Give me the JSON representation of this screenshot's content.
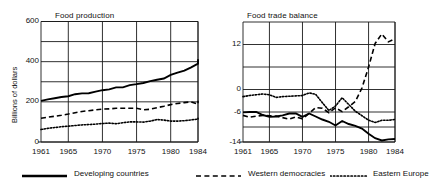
{
  "figure": {
    "ylabel": "Billions of dollars",
    "legend": [
      {
        "label": "Developing countries",
        "style": "solid"
      },
      {
        "label": "Western democracies",
        "style": "dashed"
      },
      {
        "label": "Eastern Europe",
        "style": "dotted"
      }
    ]
  },
  "chart_data": [
    {
      "type": "line",
      "title": "Food production",
      "xlabel": "",
      "ylabel": "Billions of dollars",
      "xlim": [
        1961,
        1984
      ],
      "ylim": [
        0,
        600
      ],
      "yticks": [
        0,
        200,
        400,
        600
      ],
      "xticks": [
        1961,
        1965,
        1970,
        1975,
        1980,
        1984
      ],
      "grid": true,
      "legend_position": "below-figure",
      "x": [
        1961,
        1962,
        1963,
        1964,
        1965,
        1966,
        1967,
        1968,
        1969,
        1970,
        1971,
        1972,
        1973,
        1974,
        1975,
        1976,
        1977,
        1978,
        1979,
        1980,
        1981,
        1982,
        1983,
        1984
      ],
      "series": [
        {
          "name": "Developing countries",
          "style": "solid",
          "values": [
            205,
            212,
            218,
            224,
            228,
            238,
            242,
            243,
            251,
            258,
            262,
            272,
            272,
            283,
            288,
            294,
            303,
            310,
            316,
            334,
            345,
            355,
            372,
            390,
            412
          ]
        },
        {
          "name": "Western democracies",
          "style": "dashed",
          "values": [
            118,
            124,
            128,
            133,
            139,
            146,
            152,
            156,
            160,
            164,
            165,
            168,
            168,
            168,
            168,
            160,
            163,
            171,
            178,
            186,
            192,
            196,
            200,
            188,
            205
          ]
        },
        {
          "name": "Eastern Europe",
          "style": "dotted",
          "values": [
            62,
            68,
            72,
            76,
            79,
            82,
            85,
            87,
            89,
            92,
            94,
            91,
            96,
            100,
            100,
            99,
            104,
            112,
            109,
            104,
            104,
            106,
            110,
            114,
            118
          ]
        }
      ]
    },
    {
      "type": "line",
      "title": "Food trade balance",
      "xlabel": "",
      "ylabel": "",
      "xlim": [
        1961,
        1984
      ],
      "ylim": [
        -14,
        18
      ],
      "yticks": [
        -14,
        -6,
        0,
        12
      ],
      "xticks": [
        1961,
        1965,
        1970,
        1975,
        1980,
        1984
      ],
      "grid": true,
      "legend_position": "below-figure",
      "x": [
        1961,
        1962,
        1963,
        1964,
        1965,
        1966,
        1967,
        1968,
        1969,
        1970,
        1971,
        1972,
        1973,
        1974,
        1975,
        1976,
        1977,
        1978,
        1979,
        1980,
        1981,
        1982,
        1983,
        1984
      ],
      "series": [
        {
          "name": "Developing countries",
          "style": "solid",
          "values": [
            -6.1,
            -6.0,
            -6.0,
            -6.8,
            -7.3,
            -7.2,
            -6.9,
            -6.4,
            -6.4,
            -7.3,
            -6.4,
            -7.2,
            -8.0,
            -8.6,
            -9.6,
            -8.4,
            -9.2,
            -9.7,
            -10.4,
            -11.8,
            -13.0,
            -13.6,
            -13.3,
            -13.2
          ]
        },
        {
          "name": "Western democracies",
          "style": "dashed",
          "values": [
            -6.9,
            -7.4,
            -7.1,
            -6.9,
            -7.0,
            -7.1,
            -7.5,
            -7.9,
            -7.3,
            -7.8,
            -6.4,
            -4.8,
            -5.0,
            -6.2,
            -4.9,
            -5.9,
            -4.6,
            -3.2,
            0.4,
            6.0,
            12.3,
            14.8,
            12.7,
            13.5
          ]
        },
        {
          "name": "Eastern Europe",
          "style": "dotted",
          "values": [
            -1.9,
            -1.6,
            -1.4,
            -1.2,
            -1.4,
            -2.1,
            -1.9,
            -1.8,
            -1.7,
            -1.6,
            -0.9,
            -1.3,
            -3.5,
            -5.6,
            -4.4,
            -2.2,
            -4.0,
            -5.8,
            -7.0,
            -8.2,
            -8.8,
            -8.2,
            -8.2,
            -8.0
          ]
        }
      ]
    }
  ]
}
